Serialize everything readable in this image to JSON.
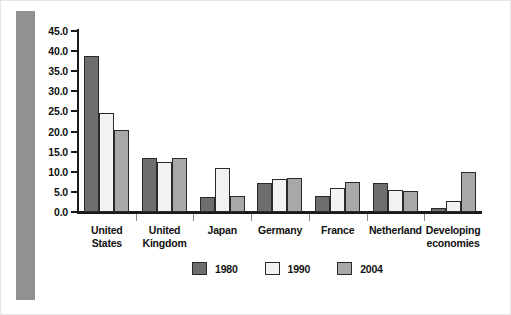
{
  "chart_data": {
    "type": "bar",
    "title": "",
    "subtitle": "",
    "xlabel": "",
    "ylabel": "",
    "ylim": [
      0.0,
      45.0
    ],
    "ytick_values": [
      0.0,
      5.0,
      10.0,
      15.0,
      20.0,
      25.0,
      30.0,
      35.0,
      40.0,
      45.0
    ],
    "ytick_labels": [
      "0.0",
      "5.0",
      "10.0",
      "15.0",
      "20.0",
      "25.0",
      "30.0",
      "35.0",
      "40.0",
      "45.0"
    ],
    "grid": false,
    "legend_position": "bottom-center",
    "categories": [
      "United States",
      "United Kingdom",
      "Japan",
      "Germany",
      "France",
      "Netherland",
      "Developing economies"
    ],
    "category_lines": [
      [
        "United",
        "States"
      ],
      [
        "United",
        "Kingdom"
      ],
      [
        "Japan"
      ],
      [
        "Germany"
      ],
      [
        "France"
      ],
      [
        "Netherland"
      ],
      [
        "Developing",
        "economies"
      ]
    ],
    "series": [
      {
        "name": "1980",
        "color": "#6e6e6e",
        "values": [
          38.8,
          13.4,
          3.7,
          7.2,
          4.0,
          7.3,
          1.0
        ]
      },
      {
        "name": "1990",
        "color": "#f2f2f0",
        "values": [
          24.6,
          12.4,
          11.0,
          8.2,
          6.0,
          5.5,
          2.8
        ]
      },
      {
        "name": "2004",
        "color": "#a8a8a8",
        "values": [
          20.4,
          13.4,
          4.0,
          8.5,
          7.5,
          5.2,
          10.0
        ]
      }
    ]
  },
  "legend": {
    "items": [
      {
        "label": "1980",
        "color": "#6e6e6e"
      },
      {
        "label": "1990",
        "color": "#f2f2f0"
      },
      {
        "label": "2004",
        "color": "#a8a8a8"
      }
    ]
  },
  "axis": {
    "y_labels": [
      "45.0",
      "40.0",
      "35.0",
      "30.0",
      "25.0",
      "20.0",
      "15.0",
      "10.0",
      "5.0",
      "0.0"
    ]
  },
  "colors": {
    "series_1980": "#6e6e6e",
    "series_1990": "#f2f2f0",
    "series_2004": "#a8a8a8",
    "axis": "#1a1a1a",
    "left_band": "#919191",
    "background": "#ffffff"
  }
}
